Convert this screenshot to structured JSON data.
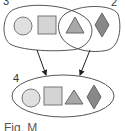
{
  "diagram": {
    "sets": [
      {
        "id": "set-3",
        "label": "3",
        "members": [
          "circle",
          "square",
          "triangle"
        ]
      },
      {
        "id": "set-2",
        "label": "2",
        "members": [
          "triangle",
          "diamond"
        ]
      },
      {
        "id": "set-4",
        "label": "4",
        "members": [
          "circle",
          "square",
          "triangle",
          "diamond"
        ]
      }
    ],
    "shared_member": "triangle",
    "arrows": [
      {
        "from": "set-3",
        "to": "set-4"
      },
      {
        "from": "set-2",
        "to": "set-4"
      }
    ],
    "caption": "Fig. M"
  },
  "colors": {
    "outline": "#555555",
    "circle": "#e0e0e0",
    "square": "#d4d4d4",
    "triangle": "#a8a8a8",
    "diamond": "#888888"
  }
}
